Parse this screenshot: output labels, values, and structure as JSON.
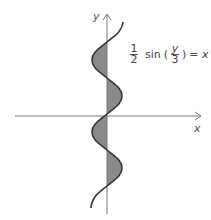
{
  "figure": {
    "x_label": "x",
    "y_label": "y",
    "equation": {
      "coef_num": "1",
      "coef_den": "2",
      "func": "sin",
      "arg_num": "y",
      "arg_den": "3",
      "rhs": "= x"
    },
    "colors": {
      "curve": "#333333",
      "axis": "#666666",
      "fill": "#8a8a8a"
    }
  }
}
